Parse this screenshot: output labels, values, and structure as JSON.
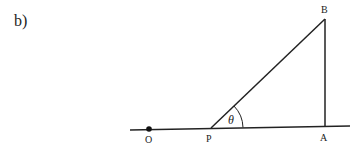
{
  "part_label": "b)",
  "diagram": {
    "points": {
      "O": {
        "label": "O",
        "x": 149,
        "y": 129
      },
      "P": {
        "label": "P",
        "x": 211,
        "y": 128
      },
      "A": {
        "label": "A",
        "x": 325,
        "y": 127
      },
      "B": {
        "label": "B",
        "x": 325,
        "y": 19
      }
    },
    "angle_label": "θ",
    "colors": {
      "line": "#222222",
      "background": "#ffffff"
    }
  }
}
